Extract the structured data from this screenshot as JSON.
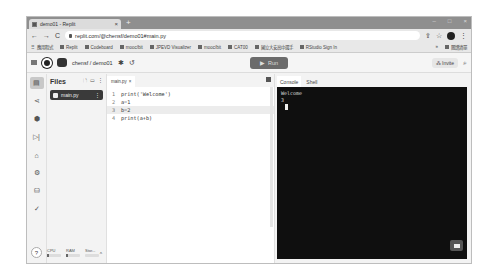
{
  "browser": {
    "tab_title": "demo01 - Replit",
    "tab_close": "×",
    "new_tab": "+",
    "window_controls": [
      "–",
      "□",
      "×"
    ],
    "url": "replit.com/@chensf/demo01#main.py",
    "nav": {
      "back": "←",
      "forward": "→",
      "reload": "C"
    },
    "bookmarks": [
      {
        "label": "應用程式",
        "icon": "apps-icon"
      },
      {
        "label": "Replit",
        "icon": "replit-icon"
      },
      {
        "label": "Codeboard",
        "icon": "codeboard-icon"
      },
      {
        "label": "mooc/bit",
        "icon": "link-icon"
      },
      {
        "label": "JPEVD Visualizer",
        "icon": "visualizer-icon"
      },
      {
        "label": "mooc/bit",
        "icon": "link-icon"
      },
      {
        "label": "CAT00",
        "icon": "bookmark-icon"
      },
      {
        "label": "國立大安高中選手",
        "icon": "bookmark-icon"
      },
      {
        "label": "RStudio Sign In",
        "icon": "rstudio-icon"
      }
    ],
    "bookmarks_right": {
      "more": "»",
      "reading_list": "閱讀清單"
    }
  },
  "replit": {
    "breadcrumb": "chensf / demo01",
    "run_label": "Run",
    "invite_label": "Invite",
    "files_title": "Files",
    "files": [
      {
        "name": "main.py"
      }
    ],
    "editor_tab": "main.py",
    "editor_tab_close": "×",
    "code_lines": [
      {
        "num": "1",
        "text": "print('Welcome')"
      },
      {
        "num": "2",
        "text": "a=1"
      },
      {
        "num": "3",
        "text": "b=2"
      },
      {
        "num": "4",
        "text": "print(a+b)"
      }
    ],
    "active_line": 3,
    "console_tabs": [
      "Console",
      "Shell"
    ],
    "console_output": [
      "Welcome",
      "3"
    ],
    "resources": [
      {
        "label": "CPU"
      },
      {
        "label": "RAM"
      },
      {
        "label": "Stor..."
      }
    ],
    "help": "?",
    "collapse": "^"
  }
}
